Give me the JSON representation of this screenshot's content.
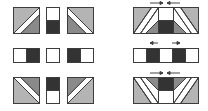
{
  "colors": {
    "background": "#ffffff",
    "stroke": "#3c3c3c",
    "light": "#b4b4b4",
    "mid": "#8a8a8a",
    "dark": "#333333",
    "white": "#ffffff",
    "arrow": "#444444"
  },
  "left_grid": {
    "rows": [
      {
        "name": "top-row",
        "pieces": [
          {
            "name": "half-square-triangle-a",
            "x": 13,
            "y": 7,
            "w": 26,
            "h": 26
          },
          {
            "name": "half-rect-dark-bottom",
            "x": 46,
            "y": 7,
            "w": 13,
            "h": 26
          },
          {
            "name": "half-square-triangle-b",
            "x": 67,
            "y": 7,
            "w": 26,
            "h": 26
          }
        ]
      },
      {
        "name": "middle-row",
        "pieces": [
          {
            "name": "rect-white-dark",
            "x": 13,
            "y": 48,
            "w": 26,
            "h": 14
          },
          {
            "name": "small-white-square",
            "x": 46,
            "y": 48,
            "w": 13,
            "h": 14
          },
          {
            "name": "rect-dark-white",
            "x": 67,
            "y": 48,
            "w": 26,
            "h": 14
          }
        ]
      },
      {
        "name": "bottom-row",
        "pieces": [
          {
            "name": "half-square-triangle-c",
            "x": 13,
            "y": 77,
            "w": 26,
            "h": 26
          },
          {
            "name": "half-rect-dark-top",
            "x": 46,
            "y": 77,
            "w": 13,
            "h": 26
          },
          {
            "name": "half-square-triangle-d",
            "x": 67,
            "y": 77,
            "w": 26,
            "h": 26
          }
        ]
      }
    ]
  },
  "right_assembly": {
    "rows": [
      {
        "name": "top-assembled-strip",
        "x": 133,
        "y": 7,
        "w": 65,
        "h": 26,
        "arrows_y": 3,
        "arrows": [
          "right",
          "left"
        ]
      },
      {
        "name": "middle-assembled-strip",
        "x": 133,
        "y": 48,
        "w": 65,
        "h": 14,
        "arrows_y": 43,
        "arrows": [
          "left",
          "right"
        ]
      },
      {
        "name": "bottom-assembled-strip",
        "x": 133,
        "y": 77,
        "w": 65,
        "h": 26,
        "arrows_y": 73,
        "arrows": [
          "right",
          "left"
        ]
      }
    ]
  }
}
